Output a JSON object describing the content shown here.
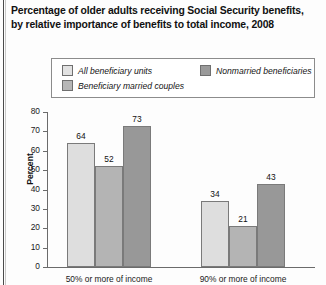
{
  "title": {
    "line1": "Percentage of older adults receiving Social Security benefits,",
    "line2": "by relative importance of benefits to total income, 2008"
  },
  "legend": {
    "items": [
      {
        "label": "All beneficiary units",
        "swatch": "light",
        "color": "#e2e2e2"
      },
      {
        "label": "Beneficiary married couples",
        "swatch": "mid",
        "color": "#b6b6b6"
      },
      {
        "label": "Nonmarried beneficiaries",
        "swatch": "dark",
        "color": "#9a9a9a"
      }
    ]
  },
  "axis": {
    "ylabel": "Percent",
    "yticks": [
      "80",
      "70",
      "60",
      "50",
      "40",
      "30",
      "20",
      "10",
      "0"
    ]
  },
  "chart_data": {
    "type": "bar",
    "title": "Percentage of older adults receiving Social Security benefits, by relative importance of benefits to total income, 2008",
    "xlabel": "",
    "ylabel": "Percent",
    "ylim": [
      0,
      80
    ],
    "ytick_step": 10,
    "grid": false,
    "legend_position": "top",
    "categories": [
      "50% or more of income",
      "90% or more of income"
    ],
    "series": [
      {
        "name": "All beneficiary units",
        "color": "#dedede",
        "values": [
          64,
          34
        ]
      },
      {
        "name": "Beneficiary married couples",
        "color": "#b4b4b4",
        "values": [
          52,
          21
        ]
      },
      {
        "name": "Nonmarried beneficiaries",
        "color": "#989898",
        "values": [
          73,
          43
        ]
      }
    ]
  }
}
